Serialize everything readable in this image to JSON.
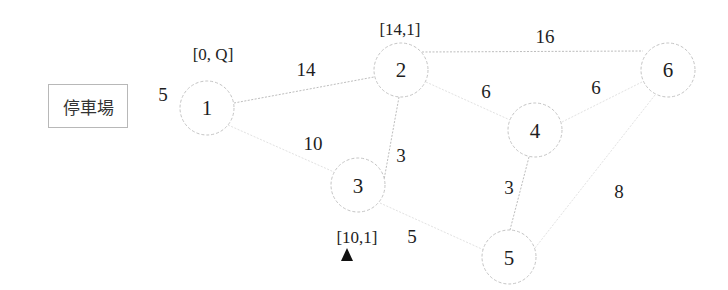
{
  "diagram": {
    "type": "weighted-graph",
    "depot": {
      "label": "停車場",
      "edge_to_node_1_weight": "5"
    },
    "nodes": [
      {
        "id": "1",
        "label": "1",
        "x": 207,
        "y": 108,
        "annotation": "[0, Q]"
      },
      {
        "id": "2",
        "label": "2",
        "x": 401,
        "y": 70,
        "annotation": "[14,1]"
      },
      {
        "id": "3",
        "label": "3",
        "x": 358,
        "y": 185,
        "annotation": "[10,1]"
      },
      {
        "id": "4",
        "label": "4",
        "x": 535,
        "y": 130,
        "annotation": ""
      },
      {
        "id": "5",
        "label": "5",
        "x": 509,
        "y": 257,
        "annotation": ""
      },
      {
        "id": "6",
        "label": "6",
        "x": 668,
        "y": 70,
        "annotation": ""
      }
    ],
    "edges": [
      {
        "from": "1",
        "to": "2",
        "weight": "14"
      },
      {
        "from": "1",
        "to": "3",
        "weight": "10"
      },
      {
        "from": "2",
        "to": "3",
        "weight": "3"
      },
      {
        "from": "2",
        "to": "6",
        "weight": "16"
      },
      {
        "from": "2",
        "to": "4",
        "weight": "6"
      },
      {
        "from": "4",
        "to": "6",
        "weight": "6"
      },
      {
        "from": "4",
        "to": "5",
        "weight": "3"
      },
      {
        "from": "3",
        "to": "5",
        "weight": "5"
      },
      {
        "from": "6",
        "to": "5",
        "weight": "8"
      }
    ],
    "marker": {
      "shape": "triangle-up",
      "below_node": "3",
      "color": "#111111"
    }
  }
}
